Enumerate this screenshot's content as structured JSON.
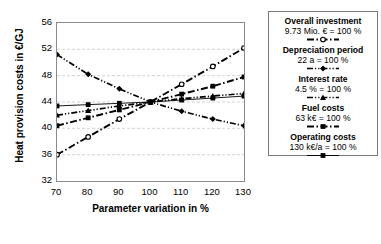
{
  "chart_data": {
    "type": "line",
    "title": "",
    "xlabel": "Parameter variation in %",
    "ylabel": "Heat provision costs in €/GJ",
    "xlim": [
      70,
      130
    ],
    "ylim": [
      32,
      56
    ],
    "xticks": [
      70,
      80,
      90,
      100,
      110,
      120,
      130
    ],
    "yticks": [
      32,
      36,
      40,
      44,
      48,
      52,
      56
    ],
    "x": [
      70,
      80,
      90,
      100,
      110,
      120,
      130
    ],
    "grid": "horizontal-dashed",
    "legend_position": "right-outside",
    "series": [
      {
        "name": "Overall investment",
        "reference": "9.73 Mio. € = 100 %",
        "style": "dash-dot",
        "marker": "circle-open",
        "values": [
          36.0,
          38.7,
          41.4,
          44.0,
          46.7,
          49.4,
          52.2
        ]
      },
      {
        "name": "Depreciation period",
        "reference": "22 a = 100 %",
        "style": "dash-dot-dot",
        "marker": "diamond",
        "values": [
          51.2,
          48.2,
          46.0,
          44.0,
          42.6,
          41.4,
          40.4
        ]
      },
      {
        "name": "Interest rate",
        "reference": "4.5 % = 100 %",
        "style": "dash-dot-dot",
        "marker": "triangle",
        "values": [
          42.0,
          42.7,
          43.4,
          44.0,
          44.5,
          44.9,
          45.3
        ]
      },
      {
        "name": "Fuel costs",
        "reference": "63 k€ = 100 %",
        "style": "dash-dot",
        "marker": "square",
        "values": [
          40.4,
          41.6,
          42.8,
          44.0,
          45.2,
          46.4,
          47.8
        ]
      },
      {
        "name": "Operating costs",
        "reference": "130 k€/a = 100 %",
        "style": "solid-thin",
        "marker": "square",
        "values": [
          43.4,
          43.6,
          43.8,
          44.0,
          44.3,
          44.6,
          44.9
        ]
      }
    ]
  },
  "colors": {
    "line": "#000000",
    "grid": "#c8c8c8",
    "frame": "#8a8a8a",
    "background": "#ffffff"
  }
}
